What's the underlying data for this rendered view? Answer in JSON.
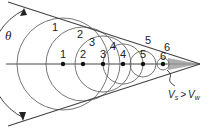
{
  "diagram": {
    "angle_label": "θ",
    "condition_label": {
      "v1": "V",
      "sub1": "s",
      "op": ">",
      "v2": "V",
      "sub2": "w"
    },
    "source_positions": [
      {
        "label": "1",
        "cx": 63,
        "r": 0
      },
      {
        "label": "2",
        "cx": 83,
        "r": 0
      },
      {
        "label": "3",
        "cx": 103,
        "r": 0
      },
      {
        "label": "4",
        "cx": 123,
        "r": 0
      },
      {
        "label": "5",
        "cx": 143,
        "r": 0
      },
      {
        "label": "6",
        "cx": 163,
        "r": 0
      }
    ],
    "wavefronts": [
      {
        "label": "1",
        "cx": 63,
        "r": 46
      },
      {
        "label": "2",
        "cx": 83,
        "r": 37
      },
      {
        "label": "3",
        "cx": 103,
        "r": 28
      },
      {
        "label": "4",
        "cx": 123,
        "r": 20
      },
      {
        "label": "5",
        "cx": 143,
        "r": 13
      },
      {
        "label": "6",
        "cx": 163,
        "r": 6
      }
    ],
    "colors": {
      "line": "#444444",
      "circle": "#666666",
      "cone_fill": "#9a9a9a",
      "dot": "#111111"
    }
  }
}
